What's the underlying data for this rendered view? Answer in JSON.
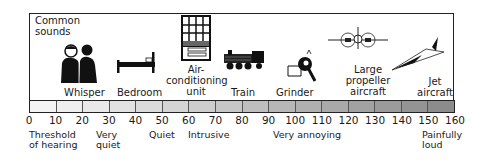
{
  "diagram": {
    "title_line1": "Common",
    "title_line2": "sounds",
    "sources": [
      {
        "name": "whisper",
        "label": "Whisper",
        "lines": [
          "Whisper"
        ],
        "db": 30
      },
      {
        "name": "bedroom",
        "label": "Bedroom",
        "lines": [
          "Bedroom"
        ],
        "db": 40
      },
      {
        "name": "air-conditioning-unit",
        "label": "Air-conditioning unit",
        "lines": [
          "Air-",
          "conditioning",
          "unit"
        ],
        "db": 60
      },
      {
        "name": "train",
        "label": "Train",
        "lines": [
          "Train"
        ],
        "db": 80
      },
      {
        "name": "grinder",
        "label": "Grinder",
        "lines": [
          "Grinder"
        ],
        "db": 100
      },
      {
        "name": "large-propeller-aircraft",
        "label": "Large propeller aircraft",
        "lines": [
          "Large",
          "propeller",
          "aircraft"
        ],
        "db": 120
      },
      {
        "name": "jet-aircraft",
        "label": "Jet aircraft",
        "lines": [
          "Jet",
          "aircraft"
        ],
        "db": 150
      }
    ],
    "scale": {
      "unit": "dB",
      "min": 0,
      "max": 160,
      "step": 10,
      "ticks": [
        "0",
        "10",
        "20",
        "30",
        "40",
        "50",
        "60",
        "70",
        "80",
        "90",
        "100",
        "110",
        "120",
        "130",
        "140",
        "150",
        "160"
      ],
      "gradient_start": "#f2f2f2",
      "gradient_end": "#8c8c8c"
    },
    "descriptors": [
      {
        "lines": [
          "Threshold",
          "of hearing"
        ],
        "at": 0
      },
      {
        "lines": [
          "Very",
          "quiet"
        ],
        "at": 30
      },
      {
        "lines": [
          "Quiet"
        ],
        "at": 50
      },
      {
        "lines": [
          "Intrusive"
        ],
        "at": 60
      },
      {
        "lines": [
          "Very annoying"
        ],
        "at": 90
      },
      {
        "lines": [
          "Painfully",
          "loud"
        ],
        "at": 150
      }
    ]
  }
}
